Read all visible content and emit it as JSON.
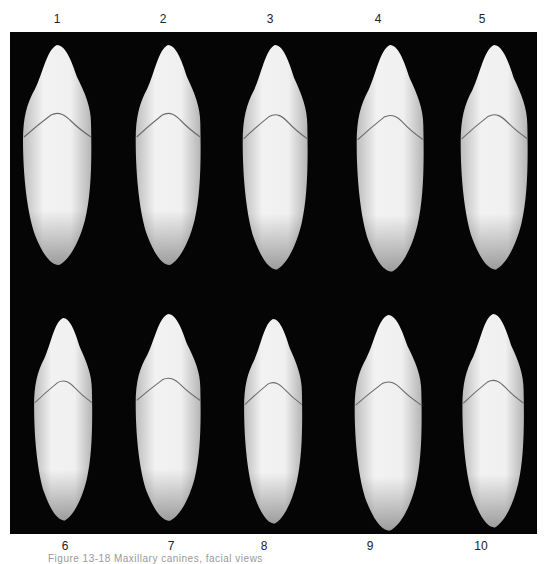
{
  "figure": {
    "top_labels": [
      "1",
      "2",
      "3",
      "4",
      "5"
    ],
    "bottom_labels": [
      "6",
      "7",
      "8",
      "9",
      "10"
    ],
    "caption": "Figure 13-18  Maxillary canines, facial views",
    "panel_color": "#050505",
    "tooth_color": "#ececec"
  }
}
